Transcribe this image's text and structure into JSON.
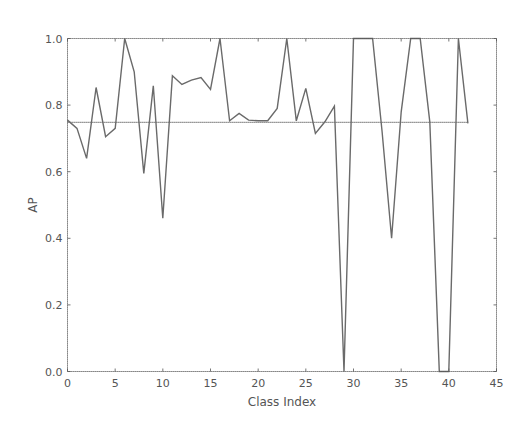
{
  "chart_data": {
    "type": "line",
    "title": "",
    "xlabel": "Class Index",
    "ylabel": "AP",
    "xlim": [
      0,
      45
    ],
    "ylim": [
      0.0,
      1.0
    ],
    "xticks": [
      "0",
      "5",
      "10",
      "15",
      "20",
      "25",
      "30",
      "35",
      "40",
      "45"
    ],
    "yticks": [
      "0.0",
      "0.2",
      "0.4",
      "0.6",
      "0.8",
      "1.0"
    ],
    "grid": false,
    "legend": null,
    "series": [
      {
        "name": "AP per class",
        "x": [
          0,
          1,
          2,
          3,
          4,
          5,
          6,
          7,
          8,
          9,
          10,
          11,
          12,
          13,
          14,
          15,
          16,
          17,
          18,
          19,
          20,
          21,
          22,
          23,
          24,
          25,
          26,
          27,
          28,
          29,
          30,
          31,
          32,
          33,
          34,
          35,
          36,
          37,
          38,
          39,
          40,
          41,
          42
        ],
        "values": [
          0.755,
          0.73,
          0.64,
          0.853,
          0.705,
          0.73,
          1.0,
          0.9,
          0.595,
          0.858,
          0.46,
          0.888,
          0.862,
          0.875,
          0.883,
          0.847,
          1.0,
          0.753,
          0.775,
          0.755,
          0.753,
          0.753,
          0.79,
          1.0,
          0.753,
          0.85,
          0.715,
          0.75,
          0.797,
          0.0,
          1.0,
          1.0,
          1.0,
          0.72,
          0.4,
          0.78,
          1.0,
          1.0,
          0.75,
          0.0,
          0.0,
          1.0,
          0.745
        ]
      },
      {
        "name": "Mean AP",
        "x": [
          0,
          42
        ],
        "values": [
          0.748,
          0.748
        ]
      }
    ]
  }
}
